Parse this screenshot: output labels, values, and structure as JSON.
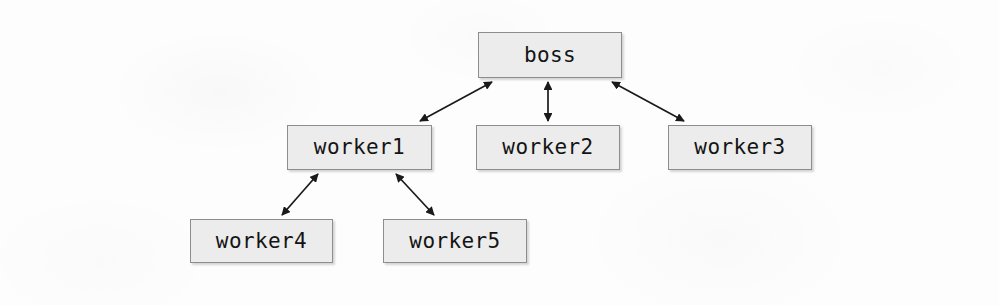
{
  "diagram": {
    "type": "node-link-diagram",
    "background_color": "#fdfdfd",
    "node_fill_color": "#ececec",
    "node_border_color": "#8d8d8d",
    "label_color": "#141414",
    "edge_color": "#1a1a1a",
    "arrow_style": "double-headed",
    "nodes": [
      {
        "id": "boss",
        "label": "boss",
        "x": 478,
        "y": 32,
        "w": 144,
        "h": 46
      },
      {
        "id": "worker1",
        "label": "worker1",
        "x": 287,
        "y": 125,
        "w": 145,
        "h": 45
      },
      {
        "id": "worker2",
        "label": "worker2",
        "x": 476,
        "y": 125,
        "w": 144,
        "h": 45
      },
      {
        "id": "worker3",
        "label": "worker3",
        "x": 668,
        "y": 125,
        "w": 144,
        "h": 45
      },
      {
        "id": "worker4",
        "label": "worker4",
        "x": 190,
        "y": 219,
        "w": 143,
        "h": 44
      },
      {
        "id": "worker5",
        "label": "worker5",
        "x": 383,
        "y": 219,
        "w": 144,
        "h": 44
      }
    ],
    "edges": [
      {
        "id": "boss-worker1",
        "from": "boss",
        "to": "worker1",
        "x1": 492,
        "y1": 82,
        "x2": 420,
        "y2": 121,
        "bidirectional": true
      },
      {
        "id": "boss-worker2",
        "from": "boss",
        "to": "worker2",
        "x1": 548,
        "y1": 82,
        "x2": 548,
        "y2": 121,
        "bidirectional": true
      },
      {
        "id": "boss-worker3",
        "from": "boss",
        "to": "worker3",
        "x1": 612,
        "y1": 82,
        "x2": 684,
        "y2": 121,
        "bidirectional": true
      },
      {
        "id": "worker1-worker4",
        "from": "worker1",
        "to": "worker4",
        "x1": 318,
        "y1": 174,
        "x2": 282,
        "y2": 215,
        "bidirectional": true
      },
      {
        "id": "worker1-worker5",
        "from": "worker1",
        "to": "worker5",
        "x1": 396,
        "y1": 174,
        "x2": 434,
        "y2": 215,
        "bidirectional": true
      }
    ]
  }
}
